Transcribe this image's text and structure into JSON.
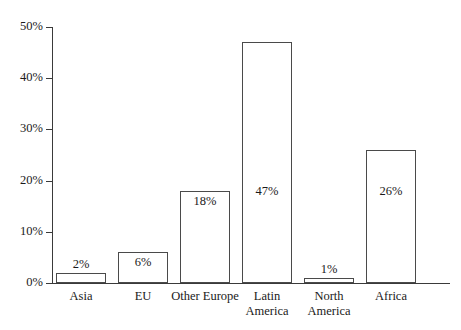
{
  "chart_data": {
    "type": "bar",
    "title": "",
    "subtitle": "",
    "xlabel": "",
    "ylabel": "",
    "categories": [
      "Asia",
      "EU",
      "Other Europe",
      "Latin\nAmerica",
      "North\nAmerica",
      "Africa"
    ],
    "values": [
      2,
      6,
      18,
      47,
      1,
      26
    ],
    "value_labels": [
      "2%",
      "6%",
      "18%",
      "47%",
      "1%",
      "26%"
    ],
    "value_label_position": [
      "above",
      "inside",
      "inside",
      "inside",
      "above",
      "inside"
    ],
    "ylim": [
      0,
      50
    ],
    "ytick_values": [
      0,
      10,
      20,
      30,
      40,
      50
    ],
    "ytick_labels": [
      "0%",
      "10%",
      "20%",
      "30%",
      "40%",
      "50%"
    ],
    "grid": false,
    "legend": false,
    "legend_position": "none",
    "bar_fill_color": "#ffffff",
    "bar_border_color": "#4a4a4a",
    "axis_color": "#3a3a3a",
    "background_color": "#ffffff",
    "text_color": "#1a1a1a"
  }
}
